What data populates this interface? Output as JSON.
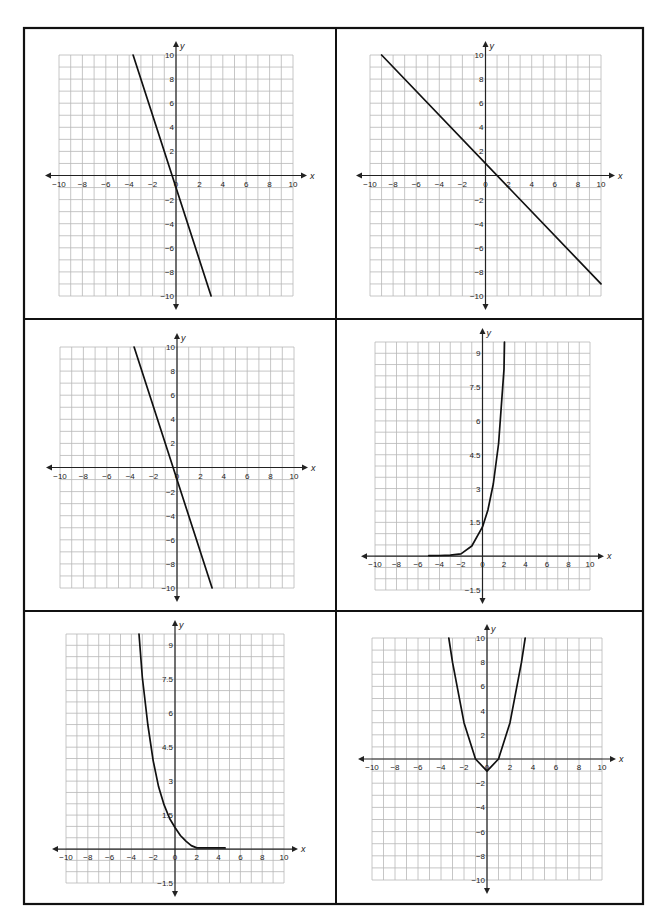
{
  "layout": {
    "frame": {
      "left": 24,
      "top": 28,
      "right": 643,
      "bottom": 904
    },
    "col_divider": 336,
    "row_dividers": [
      319,
      611
    ],
    "border_color": "#111111",
    "grid_color": "#b8b8b8",
    "axis_color": "#222222",
    "curve_color": "#111111"
  },
  "chart_data": [
    {
      "id": "graph-top-left",
      "type": "line",
      "title": "",
      "xlabel": "x",
      "ylabel": "y",
      "xlim": [
        -10,
        10
      ],
      "ylim": [
        -10,
        10
      ],
      "grid": true,
      "x_step": 1,
      "y_step": 1,
      "x_ticks": [
        -10,
        -8,
        -6,
        -4,
        -2,
        0,
        2,
        4,
        6,
        8,
        10
      ],
      "y_ticks": [
        -10,
        -8,
        -6,
        -4,
        -2,
        2,
        4,
        6,
        8,
        10
      ],
      "x_tick_labels": [
        "−10",
        "−8",
        "−6",
        "−4",
        "−2",
        "0",
        "2",
        "4",
        "6",
        "8",
        "10"
      ],
      "y_tick_labels": [
        "−10",
        "−8",
        "−6",
        "−4",
        "−2",
        "2",
        "4",
        "6",
        "8",
        "10"
      ],
      "series": [
        {
          "name": "line",
          "function": "y = -3x - 1",
          "x": [
            -3.67,
            3.0
          ],
          "y": [
            10,
            -10
          ]
        }
      ],
      "box": {
        "left": 59,
        "top": 55,
        "right": 293,
        "bottom": 296
      }
    },
    {
      "id": "graph-top-right",
      "type": "line",
      "title": "",
      "xlabel": "x",
      "ylabel": "y",
      "xlim": [
        -10,
        10
      ],
      "ylim": [
        -10,
        10
      ],
      "grid": true,
      "x_step": 1,
      "y_step": 1,
      "x_ticks": [
        -10,
        -8,
        -6,
        -4,
        -2,
        0,
        2,
        4,
        6,
        8,
        10
      ],
      "y_ticks": [
        -10,
        -8,
        -6,
        -4,
        -2,
        2,
        4,
        6,
        8,
        10
      ],
      "x_tick_labels": [
        "−10",
        "−8",
        "−6",
        "−4",
        "−2",
        "0",
        "2",
        "4",
        "6",
        "8",
        "10"
      ],
      "y_tick_labels": [
        "−10",
        "−8",
        "−6",
        "−4",
        "−2",
        "2",
        "4",
        "6",
        "8",
        "10"
      ],
      "series": [
        {
          "name": "line",
          "function": "y = -x + 1",
          "x": [
            -9,
            10
          ],
          "y": [
            10,
            -9
          ]
        }
      ],
      "box": {
        "left": 370,
        "top": 55,
        "right": 601,
        "bottom": 296
      }
    },
    {
      "id": "graph-middle-left",
      "type": "line",
      "title": "",
      "xlabel": "x",
      "ylabel": "y",
      "xlim": [
        -10,
        10
      ],
      "ylim": [
        -10,
        10
      ],
      "grid": true,
      "x_step": 1,
      "y_step": 1,
      "x_ticks": [
        -10,
        -8,
        -6,
        -4,
        -2,
        0,
        2,
        4,
        6,
        8,
        10
      ],
      "y_ticks": [
        -10,
        -8,
        -6,
        -4,
        -2,
        2,
        4,
        6,
        8,
        10
      ],
      "x_tick_labels": [
        "−10",
        "−8",
        "−6",
        "−4",
        "−2",
        "0",
        "2",
        "4",
        "6",
        "8",
        "10"
      ],
      "y_tick_labels": [
        "−10",
        "−8",
        "−6",
        "−4",
        "−2",
        "2",
        "4",
        "6",
        "8",
        "10"
      ],
      "series": [
        {
          "name": "line",
          "function": "y = -3x - 1",
          "x": [
            -3.67,
            3.0
          ],
          "y": [
            10,
            -10
          ]
        }
      ],
      "box": {
        "left": 60,
        "top": 347,
        "right": 294,
        "bottom": 588
      }
    },
    {
      "id": "graph-middle-right",
      "type": "line",
      "title": "",
      "xlabel": "x",
      "ylabel": "y",
      "xlim": [
        -10,
        10
      ],
      "ylim": [
        -1.5,
        9.5
      ],
      "grid": true,
      "x_step": 1,
      "y_step": 0.5,
      "x_ticks": [
        -10,
        -8,
        -6,
        -4,
        -2,
        0,
        2,
        4,
        6,
        8,
        10
      ],
      "y_ticks": [
        -1.5,
        1.5,
        3,
        4.5,
        6,
        7.5,
        9
      ],
      "x_tick_labels": [
        "−10",
        "−8",
        "−6",
        "−4",
        "−2",
        "0",
        "2",
        "4",
        "6",
        "8",
        "10"
      ],
      "y_tick_labels": [
        "−1.5",
        "1.5",
        "3",
        "4.5",
        "6",
        "7.5",
        "9"
      ],
      "series": [
        {
          "name": "exponential growth",
          "function": "y ≈ 1.3·2.6^x (flat near 0 for x < -2)",
          "x": [
            -5,
            -4,
            -3,
            -2,
            -1,
            0,
            0.5,
            1,
            1.5,
            2,
            2.05
          ],
          "y": [
            0.02,
            0.03,
            0.05,
            0.1,
            0.45,
            1.3,
            2.05,
            3.2,
            5.0,
            8.3,
            9.5
          ]
        }
      ],
      "box": {
        "left": 375,
        "top": 342,
        "right": 590,
        "bottom": 590
      }
    },
    {
      "id": "graph-bottom-left",
      "type": "line",
      "title": "",
      "xlabel": "x",
      "ylabel": "y",
      "xlim": [
        -10,
        10
      ],
      "ylim": [
        -1.5,
        9.5
      ],
      "grid": true,
      "x_step": 1,
      "y_step": 0.5,
      "x_ticks": [
        -10,
        -8,
        -6,
        -4,
        -2,
        0,
        2,
        4,
        6,
        8,
        10
      ],
      "y_ticks": [
        -1.5,
        1.5,
        3,
        4.5,
        6,
        7.5,
        9
      ],
      "x_tick_labels": [
        "−10",
        "−8",
        "−6",
        "−4",
        "−2",
        "0",
        "2",
        "4",
        "6",
        "8",
        "10"
      ],
      "y_tick_labels": [
        "−1.5",
        "1.5",
        "3",
        "4.5",
        "6",
        "7.5",
        "9"
      ],
      "series": [
        {
          "name": "exponential decay",
          "function": "y ≈ 1·2^(-x) (flat near 0 for x > 2)",
          "x": [
            -3.3,
            -3,
            -2.5,
            -2,
            -1.5,
            -1,
            -0.5,
            0,
            0.5,
            1,
            1.5,
            2,
            3,
            4.6
          ],
          "y": [
            9.5,
            7.6,
            5.5,
            3.9,
            2.75,
            1.95,
            1.35,
            0.95,
            0.6,
            0.35,
            0.15,
            0.05,
            0.05,
            0.05
          ]
        }
      ],
      "box": {
        "left": 66,
        "top": 634,
        "right": 284,
        "bottom": 883
      }
    },
    {
      "id": "graph-bottom-right",
      "type": "line",
      "title": "",
      "xlabel": "x",
      "ylabel": "y",
      "xlim": [
        -10,
        10
      ],
      "ylim": [
        -10,
        10
      ],
      "grid": true,
      "x_step": 1,
      "y_step": 1,
      "x_ticks": [
        -10,
        -8,
        -6,
        -4,
        -2,
        0,
        2,
        4,
        6,
        8,
        10
      ],
      "y_ticks": [
        -10,
        -8,
        -6,
        -4,
        -2,
        2,
        4,
        6,
        8,
        10
      ],
      "x_tick_labels": [
        "−10",
        "−8",
        "−6",
        "−4",
        "−2",
        "0",
        "2",
        "4",
        "6",
        "8",
        "10"
      ],
      "y_tick_labels": [
        "−10",
        "−8",
        "−6",
        "−4",
        "−2",
        "2",
        "4",
        "6",
        "8",
        "10"
      ],
      "series": [
        {
          "name": "parabola",
          "function": "y = x^2 - 1",
          "x": [
            -3.32,
            -3,
            -2,
            -1,
            0,
            1,
            2,
            3,
            3.32
          ],
          "y": [
            10,
            8,
            3,
            0,
            -1,
            0,
            3,
            8,
            10
          ]
        }
      ],
      "box": {
        "left": 372,
        "top": 638,
        "right": 602,
        "bottom": 880
      }
    }
  ]
}
